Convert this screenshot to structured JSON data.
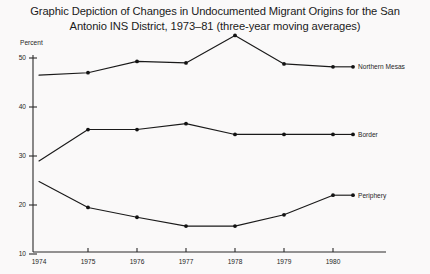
{
  "title": {
    "line1": "Graphic Depiction of Changes in Undocumented Migrant Origins for the San",
    "line2": "Antonio INS District, 1973–81 (three-year moving averages)"
  },
  "axes": {
    "y_unit_label": "Percent",
    "y_ticks": [
      "50",
      "40",
      "30",
      "20",
      "10"
    ],
    "x_ticks": [
      "1974",
      "1975",
      "1976",
      "1977",
      "1978",
      "1979",
      "1980"
    ]
  },
  "series_labels": {
    "northern_mesas": "Northern Mesas",
    "border": "Border",
    "periphery": "Periphery"
  },
  "colors": {
    "background": "#faf9f9",
    "ink": "#1a1a1a",
    "axis": "#2b2b2b"
  },
  "chart_data": {
    "type": "line",
    "title": "Graphic Depiction of Changes in Undocumented Migrant Origins for the San Antonio INS District, 1973–81 (three-year moving averages)",
    "xlabel": "",
    "ylabel": "Percent",
    "x": [
      1974,
      1975,
      1976,
      1977,
      1978,
      1979,
      1980
    ],
    "xlim": [
      1974,
      1980
    ],
    "ylim": [
      10,
      50
    ],
    "grid": false,
    "legend": "inline-right-end-labels",
    "series": [
      {
        "name": "Northern Mesas",
        "values": [
          46.5,
          47.0,
          49.3,
          49.0,
          54.6,
          48.8,
          48.2
        ]
      },
      {
        "name": "Border",
        "values": [
          29.0,
          35.4,
          35.4,
          36.6,
          34.4,
          34.4,
          34.4
        ]
      },
      {
        "name": "Periphery",
        "values": [
          24.8,
          19.5,
          17.5,
          15.7,
          15.7,
          18.0,
          22.0
        ]
      }
    ]
  }
}
